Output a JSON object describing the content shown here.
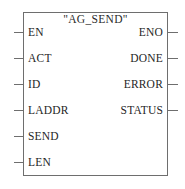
{
  "diagram": {
    "type": "function-block-diagram",
    "block": {
      "title": "\"AG_SEND\"",
      "name": "AG_SEND",
      "border_color": "#6e6e6e",
      "fill_color": "#ffffff",
      "text_color": "#262626"
    },
    "inputs": [
      {
        "label": "EN",
        "y": 32
      },
      {
        "label": "ACT",
        "y": 58
      },
      {
        "label": "ID",
        "y": 84
      },
      {
        "label": "LADDR",
        "y": 110
      },
      {
        "label": "SEND",
        "y": 136
      },
      {
        "label": "LEN",
        "y": 162
      }
    ],
    "outputs": [
      {
        "label": "ENO",
        "y": 32
      },
      {
        "label": "DONE",
        "y": 58
      },
      {
        "label": "ERROR",
        "y": 84
      },
      {
        "label": "STATUS",
        "y": 110
      }
    ]
  }
}
